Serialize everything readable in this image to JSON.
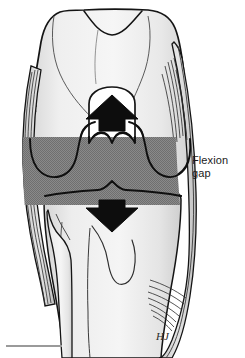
{
  "figure": {
    "type": "medical-line-art",
    "view": "anterior-knee",
    "width": 245,
    "height": 358,
    "background_color": "#ffffff"
  },
  "labels": {
    "flexion_gap_line1": "Flexion",
    "flexion_gap_line2": "gap"
  },
  "annotations": {
    "artist_signature": "HJ"
  },
  "colors": {
    "outline": "#141414",
    "bone_fill_light": "#f2f2f2",
    "bone_fill_mid": "#e2e2e2",
    "bone_fill_shadow": "#cdcdcd",
    "gap_band": "#858585",
    "arrow_fill": "#0d0d0d",
    "rule": "#9a9a9a",
    "text": "#1a1a1a"
  },
  "geometry": {
    "gap_band_top": 137,
    "gap_band_bottom": 205,
    "gap_band_left": 22,
    "gap_band_right": 188,
    "up_arrow_center_x": 113,
    "up_arrow_top": 95,
    "down_arrow_center_x": 113,
    "down_arrow_bottom": 232
  },
  "structures": [
    {
      "name": "femur",
      "label": "Distal femur"
    },
    {
      "name": "femoral-condyle-medial",
      "label": "Medial femoral condyle"
    },
    {
      "name": "femoral-condyle-lateral",
      "label": "Lateral femoral condyle"
    },
    {
      "name": "intercondylar-notch",
      "label": "Intercondylar notch"
    },
    {
      "name": "tibia",
      "label": "Proximal tibia"
    },
    {
      "name": "tibial-plateau",
      "label": "Tibial plateau"
    },
    {
      "name": "tibial-spine",
      "label": "Tibial eminence"
    },
    {
      "name": "fibula",
      "label": "Fibular head"
    },
    {
      "name": "medial-collateral-ligament",
      "label": "Medial collateral ligament"
    },
    {
      "name": "lateral-collateral-ligament",
      "label": "Lateral collateral ligament"
    },
    {
      "name": "flexion-gap-band",
      "label": "Flexion gap"
    },
    {
      "name": "distraction-arrow-up",
      "label": "Femoral distraction arrow"
    },
    {
      "name": "distraction-arrow-down",
      "label": "Tibial distraction arrow"
    }
  ]
}
